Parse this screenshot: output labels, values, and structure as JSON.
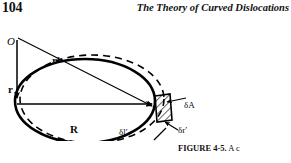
{
  "page": {
    "number": "104",
    "running_title": "The Theory of Curved Dislocations",
    "background_color": "#ffffff",
    "ink_color": "#111111"
  },
  "figure": {
    "type": "vector-diagram",
    "labels": {
      "origin": "O",
      "r_vector": "r",
      "r_prime_vector": "r′",
      "R_vector": "R",
      "delta_l_prime": "δl′",
      "delta_A": "δA",
      "delta_r_prime": "δr′"
    },
    "elements": [
      {
        "name": "solid-loop",
        "style": "solid",
        "stroke": "#000000",
        "description": "original dislocation loop"
      },
      {
        "name": "dashed-loop",
        "style": "dashed",
        "stroke": "#000000",
        "description": "expanded dislocation loop"
      },
      {
        "name": "hatched-area",
        "style": "hatched",
        "stroke": "#000000",
        "description": "swept area element δA"
      },
      {
        "name": "r-arrow",
        "style": "arrow",
        "description": "vector from O to loop element"
      },
      {
        "name": "r-prime-arrow",
        "style": "arrow",
        "description": "vector from O to field point"
      },
      {
        "name": "R-arrow",
        "style": "arrow",
        "description": "vector R across the loop"
      }
    ]
  },
  "caption": {
    "number": "FIGURE 4-5.",
    "text": "A c"
  }
}
